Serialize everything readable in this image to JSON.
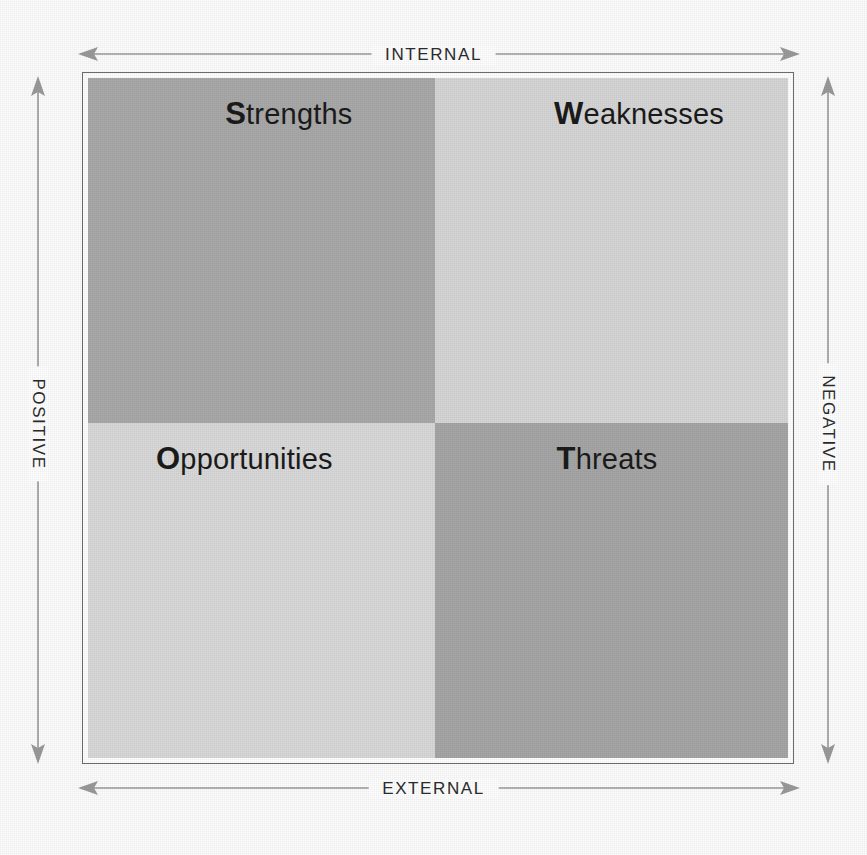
{
  "diagram": {
    "type": "swot-matrix"
  },
  "axes": {
    "top": {
      "label": "INTERNAL",
      "icon": "double-arrow-horizontal"
    },
    "bottom": {
      "label": "EXTERNAL",
      "icon": "double-arrow-horizontal"
    },
    "left": {
      "label": "POSITIVE",
      "icon": "double-arrow-vertical"
    },
    "right": {
      "label": "NEGATIVE",
      "icon": "double-arrow-vertical"
    }
  },
  "quadrants": [
    {
      "key": "strengths",
      "initial": "S",
      "rest": "trengths",
      "position": "top-left",
      "axis_x": "INTERNAL",
      "axis_y": "POSITIVE",
      "fill": "#a9a9a9"
    },
    {
      "key": "weaknesses",
      "initial": "W",
      "rest": "eaknesses",
      "position": "top-right",
      "axis_x": "INTERNAL",
      "axis_y": "NEGATIVE",
      "fill": "#d6d6d6"
    },
    {
      "key": "opportunities",
      "initial": "O",
      "rest": "pportunities",
      "position": "bottom-left",
      "axis_x": "EXTERNAL",
      "axis_y": "POSITIVE",
      "fill": "#d9d9d9"
    },
    {
      "key": "threats",
      "initial": "T",
      "rest": "hreats",
      "position": "bottom-right",
      "axis_x": "EXTERNAL",
      "axis_y": "NEGATIVE",
      "fill": "#a6a6a6"
    }
  ],
  "colors": {
    "arrow": "#9a9a9a",
    "frame": "#6e6e6e",
    "text": "#1b1b1b",
    "axis_text": "#2c2c2c",
    "page": "#fdfdfd"
  }
}
